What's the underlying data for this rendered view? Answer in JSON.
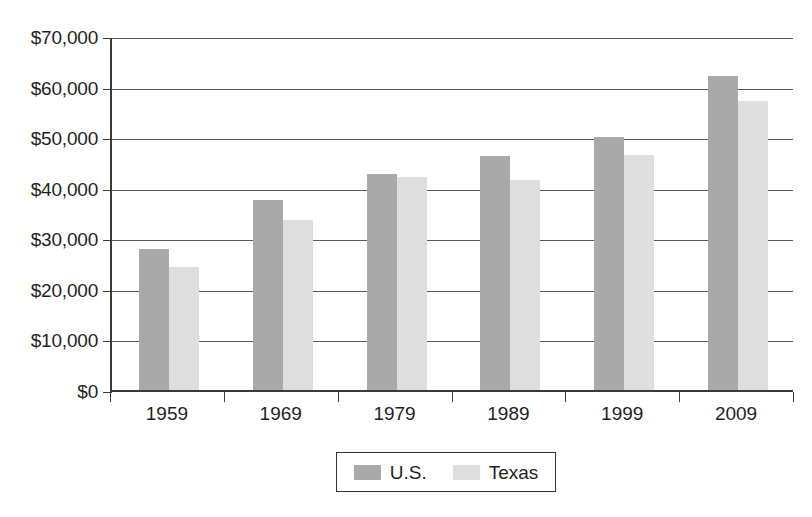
{
  "chart_data": {
    "type": "bar",
    "title": "",
    "subtitle": "",
    "xlabel": "",
    "ylabel": "",
    "categories": [
      "1959",
      "1969",
      "1979",
      "1989",
      "1999",
      "2009"
    ],
    "series": [
      {
        "name": "U.S.",
        "color": "#a9a9a9",
        "values": [
          27900,
          37600,
          42700,
          46300,
          50000,
          62100
        ]
      },
      {
        "name": "Texas",
        "color": "#dedede",
        "values": [
          24300,
          33600,
          42100,
          41500,
          46400,
          57100
        ]
      }
    ],
    "ylim": [
      0,
      70000
    ],
    "ytick_values": [
      0,
      10000,
      20000,
      30000,
      40000,
      50000,
      60000,
      70000
    ],
    "ytick_labels": [
      "$0",
      "$10,000",
      "$20,000",
      "$30,000",
      "$40,000",
      "$50,000",
      "$60,000",
      "$70,000"
    ],
    "grid": true,
    "grid_axis": "y",
    "legend_position": "bottom-center",
    "legend_entries": [
      "U.S.",
      "Texas"
    ],
    "annotations": []
  },
  "axes": {
    "y": {
      "labels": [
        "$70,000",
        "$60,000",
        "$50,000",
        "$40,000",
        "$30,000",
        "$20,000",
        "$10,000",
        "$0"
      ],
      "values": [
        70000,
        60000,
        50000,
        40000,
        30000,
        20000,
        10000,
        0
      ]
    },
    "x": {
      "labels": [
        "1959",
        "1969",
        "1979",
        "1989",
        "1999",
        "2009"
      ]
    }
  },
  "legend": {
    "items": [
      {
        "label": "U.S.",
        "swatch": "dark-gray-swatch"
      },
      {
        "label": "Texas",
        "swatch": "light-gray-swatch"
      }
    ]
  },
  "colors": {
    "us_bar": "#a9a9a9",
    "texas_bar": "#dedede",
    "axis": "#3a3a3a",
    "gridline": "#585858",
    "background": "#ffffff"
  }
}
